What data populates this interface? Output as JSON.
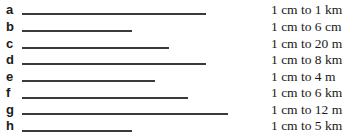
{
  "items": [
    {
      "letter": "a",
      "scale": "1 cm to 1 km",
      "line_px": 184
    },
    {
      "letter": "b",
      "scale": "1 cm to 6 cm",
      "line_px": 110
    },
    {
      "letter": "c",
      "scale": "1 cm to 20 m",
      "line_px": 147
    },
    {
      "letter": "d",
      "scale": "1 cm to 8 km",
      "line_px": 184
    },
    {
      "letter": "e",
      "scale": "1 cm to 4 m",
      "line_px": 133
    },
    {
      "letter": "f",
      "scale": "1 cm to 6 km",
      "line_px": 166
    },
    {
      "letter": "g",
      "scale": "1 cm to 12 m",
      "line_px": 206
    },
    {
      "letter": "h",
      "scale": "1 cm to 5 km",
      "line_px": 110
    }
  ]
}
